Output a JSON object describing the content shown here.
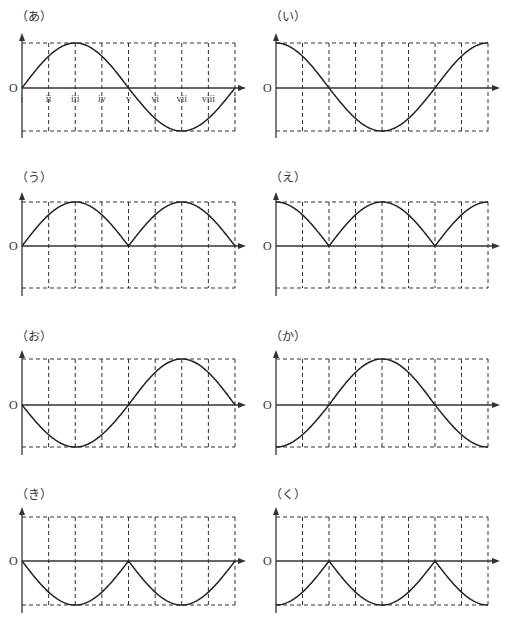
{
  "figure": {
    "origin_label": "O",
    "tick_labels": [
      "i",
      "ii",
      "iii",
      "iv",
      "v",
      "vi",
      "vii",
      "viii",
      "i"
    ],
    "tick_labels_panel": "あ",
    "grid_columns": 8,
    "panels": [
      {
        "id": "a",
        "label": "（あ）",
        "function": "sin",
        "col": 0,
        "row": 0
      },
      {
        "id": "i",
        "label": "（い）",
        "function": "cos",
        "col": 1,
        "row": 0
      },
      {
        "id": "u",
        "label": "（う）",
        "function": "abs_sin",
        "col": 0,
        "row": 1
      },
      {
        "id": "e",
        "label": "（え）",
        "function": "abs_cos",
        "col": 1,
        "row": 1
      },
      {
        "id": "o",
        "label": "（お）",
        "function": "neg_sin",
        "col": 0,
        "row": 2
      },
      {
        "id": "ka",
        "label": "（か）",
        "function": "neg_cos",
        "col": 1,
        "row": 2
      },
      {
        "id": "ki",
        "label": "（き）",
        "function": "neg_abs_sin",
        "col": 0,
        "row": 3
      },
      {
        "id": "ku",
        "label": "（く）",
        "function": "neg_abs_cos",
        "col": 1,
        "row": 3
      }
    ]
  },
  "chart_data": [
    {
      "type": "line",
      "title": "（あ）",
      "x": [
        "i",
        "ii",
        "iii",
        "iv",
        "v",
        "vi",
        "vii",
        "viii",
        "i"
      ],
      "values": [
        0,
        0.71,
        1,
        0.71,
        0,
        -0.71,
        -1,
        -0.71,
        0
      ],
      "ylim": [
        -1,
        1
      ],
      "grid": true
    },
    {
      "type": "line",
      "title": "（い）",
      "x": [
        "i",
        "ii",
        "iii",
        "iv",
        "v",
        "vi",
        "vii",
        "viii",
        "i"
      ],
      "values": [
        1,
        0.71,
        0,
        -0.71,
        -1,
        -0.71,
        0,
        0.71,
        1
      ],
      "ylim": [
        -1,
        1
      ],
      "grid": true
    },
    {
      "type": "line",
      "title": "（う）",
      "x": [
        "i",
        "ii",
        "iii",
        "iv",
        "v",
        "vi",
        "vii",
        "viii",
        "i"
      ],
      "values": [
        0,
        0.71,
        1,
        0.71,
        0,
        0.71,
        1,
        0.71,
        0
      ],
      "ylim": [
        -1,
        1
      ],
      "grid": true
    },
    {
      "type": "line",
      "title": "（え）",
      "x": [
        "i",
        "ii",
        "iii",
        "iv",
        "v",
        "vi",
        "vii",
        "viii",
        "i"
      ],
      "values": [
        1,
        0.71,
        0,
        0.71,
        1,
        0.71,
        0,
        0.71,
        1
      ],
      "ylim": [
        -1,
        1
      ],
      "grid": true
    },
    {
      "type": "line",
      "title": "（お）",
      "x": [
        "i",
        "ii",
        "iii",
        "iv",
        "v",
        "vi",
        "vii",
        "viii",
        "i"
      ],
      "values": [
        0,
        -0.71,
        -1,
        -0.71,
        0,
        0.71,
        1,
        0.71,
        0
      ],
      "ylim": [
        -1,
        1
      ],
      "grid": true
    },
    {
      "type": "line",
      "title": "（か）",
      "x": [
        "i",
        "ii",
        "iii",
        "iv",
        "v",
        "vi",
        "vii",
        "viii",
        "i"
      ],
      "values": [
        -1,
        -0.71,
        0,
        0.71,
        1,
        0.71,
        0,
        -0.71,
        -1
      ],
      "ylim": [
        -1,
        1
      ],
      "grid": true
    },
    {
      "type": "line",
      "title": "（き）",
      "x": [
        "i",
        "ii",
        "iii",
        "iv",
        "v",
        "vi",
        "vii",
        "viii",
        "i"
      ],
      "values": [
        0,
        -0.71,
        -1,
        -0.71,
        0,
        -0.71,
        -1,
        -0.71,
        0
      ],
      "ylim": [
        -1,
        1
      ],
      "grid": true
    },
    {
      "type": "line",
      "title": "（く）",
      "x": [
        "i",
        "ii",
        "iii",
        "iv",
        "v",
        "vi",
        "vii",
        "viii",
        "i"
      ],
      "values": [
        -1,
        -0.71,
        0,
        -0.71,
        -1,
        -0.71,
        0,
        -0.71,
        -1
      ],
      "ylim": [
        -1,
        1
      ],
      "grid": true
    }
  ]
}
